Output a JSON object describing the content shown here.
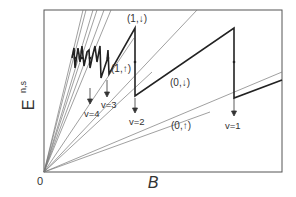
{
  "diagram": {
    "axes": {
      "ylabel": "E",
      "ylabel_sub": "n,s",
      "xlabel": "B",
      "origin_label": "0"
    },
    "level_labels": [
      {
        "text": "(1,↓)",
        "x": 127,
        "y": 22
      },
      {
        "text": "(1,↑)",
        "x": 111,
        "y": 72
      },
      {
        "text": "(0,↓)",
        "x": 170,
        "y": 86
      },
      {
        "text": "(0,↑)",
        "x": 171,
        "y": 129
      }
    ],
    "filling_labels": [
      {
        "text": "v=4",
        "x": 86,
        "y": 117
      },
      {
        "text": "v=3",
        "x": 103,
        "y": 108
      },
      {
        "text": "v=2",
        "x": 131,
        "y": 125
      },
      {
        "text": "v=1",
        "x": 226,
        "y": 129
      }
    ]
  }
}
